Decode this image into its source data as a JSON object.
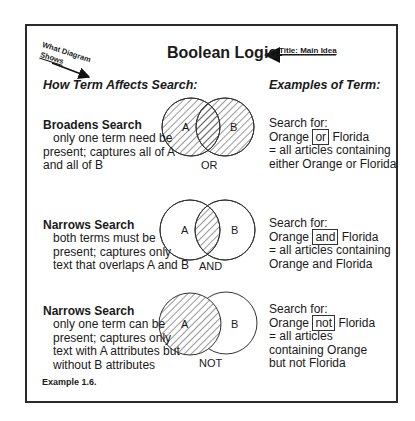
{
  "title": "Boolean Logic",
  "annotations": {
    "title_note": "Title: Main Idea",
    "what_diagram_line1": "What Diagram",
    "what_diagram_line2": "Shows"
  },
  "columns": {
    "left_header": "How Term Affects Search:",
    "right_header": "Examples of Term:"
  },
  "rows": [
    {
      "heading": "Broadens Search",
      "desc": [
        "only one term need be",
        "present; captures all of A",
        "and all of B"
      ],
      "operator": "OR",
      "venn": {
        "a": "A",
        "b": "B",
        "shaded": "union"
      },
      "example": {
        "line1": "Search for:",
        "pre": "Orange",
        "op": "or",
        "post": "Florida",
        "result": [
          "= all articles containing",
          "either Orange or Florida"
        ]
      }
    },
    {
      "heading": "Narrows Search",
      "desc": [
        "both terms must be",
        "present; captures only",
        "text that overlaps A and B"
      ],
      "operator": "AND",
      "venn": {
        "a": "A",
        "b": "B",
        "shaded": "intersection"
      },
      "example": {
        "line1": "Search for:",
        "pre": "Orange",
        "op": "and",
        "post": "Florida",
        "result": [
          "= all articles containing",
          "Orange and Florida"
        ]
      }
    },
    {
      "heading": "Narrows Search",
      "desc": [
        "only one term can be",
        "present; captures only",
        "text with A attributes but",
        "without B attributes"
      ],
      "operator": "NOT",
      "venn": {
        "a": "A",
        "b": "B",
        "shaded": "A only"
      },
      "example": {
        "line1": "Search for:",
        "pre": "Orange",
        "op": "not",
        "post": "Florida",
        "result": [
          "= all articles",
          "containing Orange",
          "but not Florida"
        ]
      }
    }
  ],
  "caption": "Example 1.6.",
  "colors": {
    "ink": "#1a1a1a",
    "frame": "#2b2b2b",
    "background": "#ffffff"
  }
}
